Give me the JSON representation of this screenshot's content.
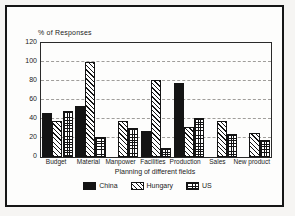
{
  "chart_data": {
    "type": "bar",
    "title": "% of Responses",
    "ylabel": "% of Responses",
    "xlabel": "Planning of different fields",
    "categories": [
      "Budget",
      "Material",
      "Manpower",
      "Facilities",
      "Production",
      "Sales",
      "New product"
    ],
    "series": [
      {
        "name": "China",
        "pattern": "solid",
        "color": "#141414",
        "values": [
          46,
          54,
          0,
          27,
          78,
          0,
          0
        ]
      },
      {
        "name": "Hungary",
        "pattern": "diagonal-hatch",
        "color": "#ffffff",
        "values": [
          38,
          100,
          38,
          81,
          32,
          38,
          25
        ]
      },
      {
        "name": "US",
        "pattern": "grid",
        "color": "#ffffff",
        "values": [
          48,
          21,
          31,
          10,
          41,
          24,
          18
        ]
      }
    ],
    "ylim": [
      0,
      120
    ],
    "yticks": [
      0,
      20,
      40,
      60,
      80,
      100,
      120
    ],
    "grid": true,
    "gridline_style": "dashed",
    "legend_position": "bottom",
    "frame_color": "#161616",
    "background_color": "#fdfdfc"
  }
}
